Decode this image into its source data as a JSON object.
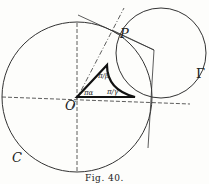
{
  "diagram": {
    "caption": "Fig. 40.",
    "labels": {
      "P": "P",
      "O": "O",
      "C": "C",
      "Gamma": "Γ",
      "angle_alpha": "πα",
      "angle_beta": "π/β",
      "angle_gamma": "π/γ"
    },
    "colors": {
      "ink": "#222222",
      "background": "#fdfdfb"
    }
  }
}
